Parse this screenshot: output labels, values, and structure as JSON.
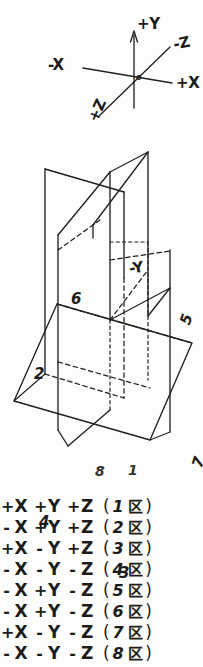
{
  "document": {
    "title": "Three-dimensional coordinate axes and the eight octants",
    "ink_color": "#20201e",
    "paper_color": "#fdfdfc"
  },
  "axes_figure": {
    "name": "coordinate-axes-sketch",
    "origin_label": "o",
    "labels": {
      "positive_y": "+Y",
      "negative_y": "-Y",
      "positive_x": "+X",
      "negative_x": "-X",
      "positive_z": "+Z",
      "negative_z": "-Z"
    }
  },
  "octant_figure": {
    "name": "three-intersecting-planes-sketch",
    "axis_label_negative_y": "-Y",
    "octant_numbers": {
      "one": "1",
      "two": "2",
      "three": "3",
      "four": "4",
      "five": "5",
      "six": "6",
      "seven": "7",
      "eight": "8"
    }
  },
  "octant_table": {
    "name": "octant-sign-list",
    "open_paren": "(",
    "close_paren": ")",
    "zone_char": "区",
    "rows": [
      {
        "sx": "+",
        "x": "X",
        "sy": "+",
        "y": "Y",
        "sz": "+",
        "z": "Z",
        "n": "1"
      },
      {
        "sx": "-",
        "x": "X",
        "sy": "+",
        "y": "Y",
        "sz": "+",
        "z": "Z",
        "n": "2"
      },
      {
        "sx": "+",
        "x": "X",
        "sy": "-",
        "y": "Y",
        "sz": "+",
        "z": "Z",
        "n": "3"
      },
      {
        "sx": "-",
        "x": "X",
        "sy": "-",
        "y": "Y",
        "sz": "-",
        "z": "Z",
        "n": "4"
      },
      {
        "sx": "-",
        "x": "X",
        "sy": "+",
        "y": "Y",
        "sz": "-",
        "z": "Z",
        "n": "5"
      },
      {
        "sx": "-",
        "x": "X",
        "sy": "+",
        "y": "Y",
        "sz": "-",
        "z": "Z",
        "n": "6"
      },
      {
        "sx": "+",
        "x": "X",
        "sy": "-",
        "y": "Y",
        "sz": "-",
        "z": "Z",
        "n": "7"
      },
      {
        "sx": "-",
        "x": "X",
        "sy": "-",
        "y": "Y",
        "sz": "-",
        "z": "Z",
        "n": "8"
      }
    ]
  }
}
